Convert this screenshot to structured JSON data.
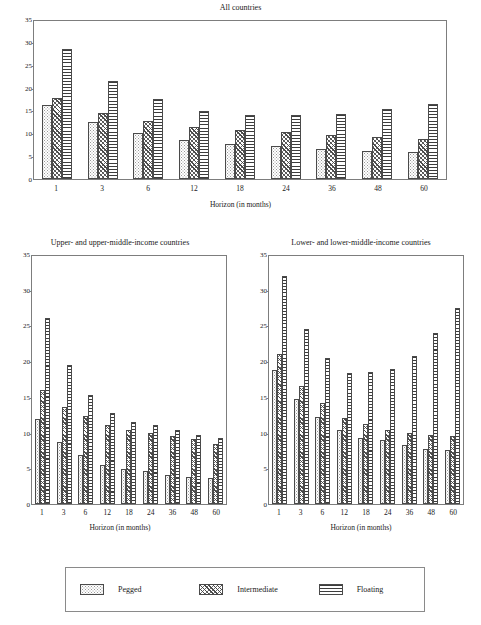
{
  "figure": {
    "background": "#ffffff",
    "width": 481,
    "height": 625
  },
  "legend": {
    "entries": [
      {
        "label": "Pegged",
        "pattern": "dotted",
        "swatch_name": "legend-swatch-pegged"
      },
      {
        "label": "Intermediate",
        "pattern": "diagonal-hatch",
        "swatch_name": "legend-swatch-intermediate"
      },
      {
        "label": "Floating",
        "pattern": "horizontal-lines",
        "swatch_name": "legend-swatch-floating"
      }
    ]
  },
  "chart_data": [
    {
      "type": "bar",
      "id": "all-countries",
      "title": "All countries",
      "xlabel": "Horizon (in months)",
      "ylabel": "",
      "categories": [
        "1",
        "3",
        "6",
        "12",
        "18",
        "24",
        "36",
        "48",
        "60"
      ],
      "ylim": [
        0,
        35
      ],
      "yticks": [
        0,
        5,
        10,
        15,
        20,
        25,
        30,
        35
      ],
      "grid": false,
      "legend_position": "below-figure",
      "series": [
        {
          "name": "Pegged",
          "values": [
            16.1,
            12.4,
            10.1,
            8.6,
            7.7,
            7.3,
            6.6,
            6.1,
            5.9
          ]
        },
        {
          "name": "Intermediate",
          "values": [
            17.7,
            14.5,
            12.8,
            11.4,
            10.7,
            10.2,
            9.7,
            9.3,
            8.8
          ]
        },
        {
          "name": "Floating",
          "values": [
            28.4,
            21.4,
            17.5,
            14.9,
            14.0,
            13.9,
            14.2,
            15.3,
            16.5
          ]
        }
      ]
    },
    {
      "type": "bar",
      "id": "upper-income",
      "title": "Upper- and upper-middle-income countries",
      "xlabel": "Horizon (in months)",
      "ylabel": "",
      "categories": [
        "1",
        "3",
        "6",
        "12",
        "18",
        "24",
        "36",
        "48",
        "60"
      ],
      "ylim": [
        0,
        35
      ],
      "yticks": [
        0,
        5,
        10,
        15,
        20,
        25,
        30,
        35
      ],
      "grid": false,
      "legend_position": "below-figure",
      "series": [
        {
          "name": "Pegged",
          "values": [
            11.9,
            8.7,
            6.8,
            5.4,
            4.9,
            4.6,
            4.1,
            3.8,
            3.6
          ]
        },
        {
          "name": "Intermediate",
          "values": [
            16.0,
            13.6,
            12.3,
            11.1,
            10.4,
            10.0,
            9.5,
            9.1,
            8.4
          ]
        },
        {
          "name": "Floating",
          "values": [
            26.0,
            19.4,
            15.3,
            12.8,
            11.5,
            11.0,
            10.3,
            9.7,
            9.2
          ]
        }
      ]
    },
    {
      "type": "bar",
      "id": "lower-income",
      "title": "Lower- and lower-middle-income countries",
      "xlabel": "Horizon (in months)",
      "ylabel": "",
      "categories": [
        "1",
        "3",
        "6",
        "12",
        "18",
        "24",
        "36",
        "48",
        "60"
      ],
      "ylim": [
        0,
        35
      ],
      "yticks": [
        0,
        5,
        10,
        15,
        20,
        25,
        30,
        35
      ],
      "grid": false,
      "legend_position": "below-figure",
      "series": [
        {
          "name": "Pegged",
          "values": [
            18.7,
            14.7,
            12.2,
            10.3,
            9.3,
            9.0,
            8.2,
            7.7,
            7.5
          ]
        },
        {
          "name": "Intermediate",
          "values": [
            21.0,
            16.5,
            14.1,
            12.1,
            11.2,
            10.4,
            9.9,
            9.6,
            9.5
          ]
        },
        {
          "name": "Floating",
          "values": [
            31.9,
            24.5,
            20.4,
            18.4,
            18.5,
            18.9,
            20.7,
            23.9,
            27.4
          ]
        }
      ]
    }
  ]
}
